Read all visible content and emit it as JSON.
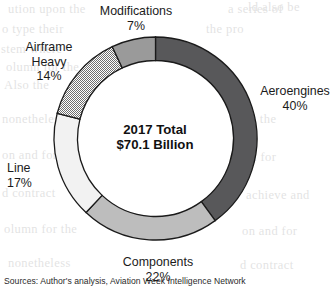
{
  "chart_data": {
    "type": "pie",
    "variant": "donut",
    "title": "",
    "center_label_line1": "2017 Total",
    "center_label_line2": "$70.1 Billion",
    "total_value": 70.1,
    "total_units": "$ Billion",
    "year": "2017",
    "start_angle_deg": 0,
    "direction": "clockwise",
    "categories": [
      "Aeroengines",
      "Components",
      "Line",
      "Airframe Heavy",
      "Modifications"
    ],
    "values": [
      40,
      22,
      17,
      14,
      7
    ],
    "value_units": "%",
    "slices": [
      {
        "label": "Aeroengines",
        "label_line1": "Aeroengines",
        "label_line2": "",
        "pct": 40,
        "pct_text": "40%",
        "fill": "#58585a",
        "pattern": "solid"
      },
      {
        "label": "Components",
        "label_line1": "Components",
        "label_line2": "",
        "pct": 22,
        "pct_text": "22%",
        "fill": "#bdbdbd",
        "pattern": "solid"
      },
      {
        "label": "Line",
        "label_line1": "Line",
        "label_line2": "",
        "pct": 17,
        "pct_text": "17%",
        "fill": "#f2f2f2",
        "pattern": "solid"
      },
      {
        "label": "Airframe Heavy",
        "label_line1": "Airframe",
        "label_line2": "Heavy",
        "pct": 14,
        "pct_text": "14%",
        "fill": "#cfcfcf",
        "pattern": "checker"
      },
      {
        "label": "Modifications",
        "label_line1": "Modifications",
        "label_line2": "",
        "pct": 7,
        "pct_text": "7%",
        "fill": "#9a9a9a",
        "pattern": "solid"
      }
    ],
    "legend": "none",
    "grid": false,
    "stroke_color": "#1a1a1a"
  },
  "source_note": "Sources: Author's analysis, Aviation Week Intelligence Network",
  "background_text": [
    "ution upon the",
    "o type their",
    "stem where",
    "olumn for the",
    "Also the",
    "nonetheless",
    "that the",
    "on and for",
    "ation for",
    "d contract",
    "achieve and",
    "a series of",
    "the pro",
    "ld also be"
  ]
}
